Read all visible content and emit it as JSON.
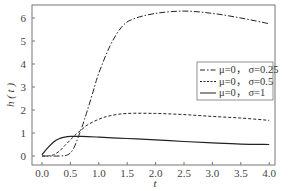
{
  "chart_data": {
    "type": "line",
    "title": "",
    "xlabel": "t",
    "ylabel": "h ( t )",
    "xlim": [
      -0.1,
      4.1
    ],
    "ylim": [
      -0.3,
      6.6
    ],
    "xticks": [
      "0.0",
      "0.5",
      "1.0",
      "1.5",
      "2.0",
      "2.5",
      "3.0",
      "3.5",
      "4.0"
    ],
    "yticks": [
      "0",
      "1",
      "2",
      "3",
      "4",
      "5",
      "6"
    ],
    "grid": false,
    "legend_position": "right-middle",
    "series": [
      {
        "name": "μ=0，σ=0.25",
        "style": "dashdot",
        "x": [
          0.0,
          0.3,
          0.45,
          0.55,
          0.65,
          0.75,
          0.9,
          1.0,
          1.2,
          1.4,
          1.6,
          2.0,
          2.5,
          3.0,
          3.5,
          4.0
        ],
        "y": [
          0.0,
          0.0,
          0.05,
          0.3,
          0.9,
          1.6,
          2.8,
          3.6,
          4.8,
          5.6,
          5.95,
          6.2,
          6.3,
          6.2,
          6.0,
          5.75
        ]
      },
      {
        "name": "μ=0，σ=0.5",
        "style": "dashed",
        "x": [
          0.0,
          0.1,
          0.2,
          0.3,
          0.4,
          0.5,
          0.6,
          0.7,
          0.8,
          1.0,
          1.2,
          1.5,
          2.0,
          2.5,
          3.0,
          3.5,
          4.0
        ],
        "y": [
          0.0,
          0.0,
          0.05,
          0.2,
          0.45,
          0.7,
          0.95,
          1.15,
          1.35,
          1.6,
          1.75,
          1.85,
          1.85,
          1.8,
          1.72,
          1.65,
          1.55
        ]
      },
      {
        "name": "μ=0，σ=1",
        "style": "solid",
        "x": [
          0.0,
          0.1,
          0.2,
          0.3,
          0.4,
          0.5,
          0.7,
          1.0,
          1.5,
          2.0,
          2.5,
          3.0,
          3.5,
          4.0
        ],
        "y": [
          0.05,
          0.35,
          0.6,
          0.75,
          0.82,
          0.85,
          0.85,
          0.82,
          0.76,
          0.7,
          0.63,
          0.57,
          0.52,
          0.5
        ]
      }
    ]
  },
  "legend": {
    "items": [
      {
        "label": "μ=0，  σ=0.25",
        "style": "dashdot"
      },
      {
        "label": "μ=0，  σ=0.5",
        "style": "dashed"
      },
      {
        "label": "μ=0，  σ=1",
        "style": "solid"
      }
    ]
  },
  "axes": {
    "xlabel": "t",
    "ylabel": "h ( t )"
  }
}
